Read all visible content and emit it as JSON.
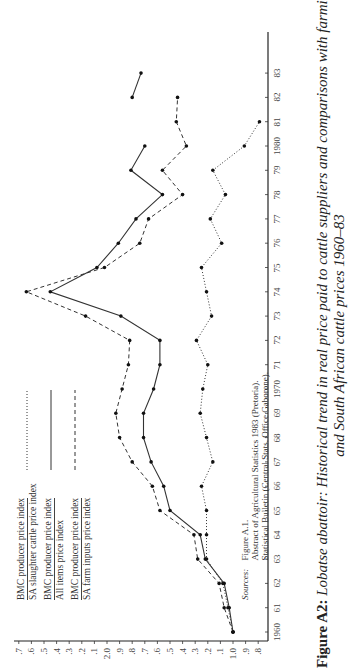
{
  "chart_data": {
    "type": "line",
    "orientation": "rotated-90-ccw",
    "title": "Figure A2: Lobatse abattoir: Historical trend in real price paid to cattle suppliers and comparisons with farming costs and South African cattle prices 1960–83",
    "xlabel": "Year",
    "ylabel": "Index ratio",
    "x": [
      1960,
      1961,
      1962,
      1963,
      1964,
      1965,
      1966,
      1967,
      1968,
      1969,
      1970,
      1971,
      1972,
      1973,
      1974,
      1975,
      1976,
      1977,
      1978,
      1979,
      1980,
      1981,
      1982,
      1983
    ],
    "x_tick_labels": [
      "1960",
      "61",
      "62",
      "63",
      "64",
      "65",
      "66",
      "67",
      "68",
      "69",
      "1970",
      "71",
      "72",
      "73",
      "74",
      "75",
      "76",
      "77",
      "78",
      "79",
      "1980",
      "81",
      "82",
      "83"
    ],
    "y_tick_labels": [
      ".8",
      ".9",
      "1.0",
      ".1",
      ".2",
      ".3",
      ".4",
      ".5",
      ".6",
      ".7",
      ".8",
      ".9",
      "2.0",
      ".1",
      ".2",
      ".3",
      ".4",
      ".5",
      ".6",
      ".7"
    ],
    "ylim": [
      0.8,
      2.7
    ],
    "grid": false,
    "series": [
      {
        "name": "BMC producer price index / SA slaughter cattle price index",
        "style": "dotted",
        "values": [
          1.0,
          1.04,
          1.08,
          1.21,
          1.21,
          1.21,
          1.25,
          1.16,
          1.21,
          1.26,
          1.24,
          1.2,
          1.29,
          1.17,
          1.21,
          1.25,
          1.09,
          1.18,
          1.06,
          1.16,
          0.91,
          0.79,
          null,
          null
        ]
      },
      {
        "name": "BMC producer price index / All items price index",
        "style": "solid",
        "values": [
          1.0,
          1.03,
          1.07,
          1.22,
          1.26,
          1.5,
          1.55,
          1.65,
          1.71,
          1.71,
          1.63,
          1.58,
          1.58,
          1.89,
          2.45,
          2.08,
          1.91,
          1.77,
          1.56,
          1.81,
          1.7,
          null,
          1.8,
          1.73
        ]
      },
      {
        "name": "BMC producer price index / SA farm inputs price index",
        "style": "dashed",
        "values": [
          1.0,
          1.07,
          1.11,
          1.28,
          1.31,
          1.58,
          1.64,
          1.8,
          1.9,
          1.93,
          1.88,
          1.83,
          1.82,
          2.17,
          2.64,
          2.02,
          1.74,
          1.67,
          1.4,
          1.56,
          1.37,
          1.45,
          1.44,
          null
        ]
      }
    ],
    "legend_position": "upper-left (rotated)"
  },
  "legend": [
    {
      "num": "BMC producer price index",
      "den": "SA slaughter cattle price index",
      "style": "dotted"
    },
    {
      "num": "BMC producer price index",
      "den": "All items price index",
      "style": "solid"
    },
    {
      "num": "BMC producer price index",
      "den": "SA farm inputs price index",
      "style": "dashed"
    }
  ],
  "sources": {
    "label": "Sources:",
    "lines": [
      "Figure A.1.",
      "Abstract of Agricultural Statistics 1983 (Pretoria).",
      "Statistical Bulletin (Central Stats. Office Gaborone)."
    ]
  },
  "caption": {
    "label": "Figure A2:",
    "line1": "Lobatse abattoir: Historical trend in real price paid to cattle suppliers and comparisons with farming costs",
    "line2": "and South African cattle prices 1960–83"
  }
}
